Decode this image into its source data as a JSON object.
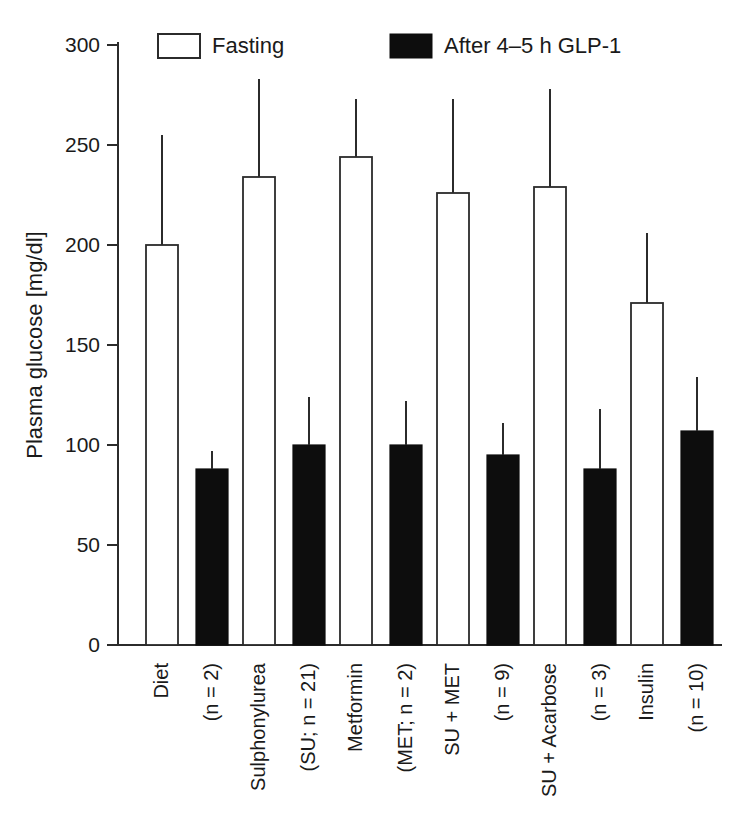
{
  "chart_data": {
    "type": "bar",
    "title": "",
    "xlabel": "",
    "ylabel": "Plasma glucose [mg/dl]",
    "ylim": [
      0,
      300
    ],
    "yticks": [
      0,
      50,
      100,
      150,
      200,
      250,
      300
    ],
    "ytick_labels": [
      "0",
      "50",
      "100",
      "150",
      "200",
      "250",
      "300"
    ],
    "grid": false,
    "legend_position": "top",
    "categories": [
      "Diet\n(n = 2)",
      "Sulphonylurea\n(SU; n = 21)",
      "Metformin\n(MET; n = 2)",
      "SU + MET\n(n = 9)",
      "SU + Acarbose\n(n = 3)",
      "Insulin\n(n = 10)"
    ],
    "category_lines": [
      [
        "Diet",
        "(n = 2)"
      ],
      [
        "Sulphonylurea",
        "(SU; n = 21)"
      ],
      [
        "Metformin",
        "(MET; n = 2)"
      ],
      [
        "SU + MET",
        "(n = 9)"
      ],
      [
        "SU + Acarbose",
        "(n = 3)"
      ],
      [
        "Insulin",
        "(n = 10)"
      ]
    ],
    "series": [
      {
        "name": "Fasting",
        "style": "open",
        "color": "#ffffff",
        "values": [
          200,
          234,
          244,
          226,
          229,
          171
        ],
        "errors_upper": [
          255,
          283,
          273,
          273,
          278,
          206
        ]
      },
      {
        "name": "After 4–5 h GLP-1",
        "style": "filled",
        "color": "#0d0d0d",
        "values": [
          88,
          100,
          100,
          95,
          88,
          107
        ],
        "errors_upper": [
          97,
          124,
          122,
          111,
          118,
          134
        ]
      }
    ]
  },
  "legend": {
    "items": [
      {
        "label": "Fasting",
        "style": "open"
      },
      {
        "label": "After 4–5 h GLP-1",
        "style": "filled"
      }
    ]
  },
  "axis": {
    "y_title": "Plasma glucose [mg/dl]"
  }
}
